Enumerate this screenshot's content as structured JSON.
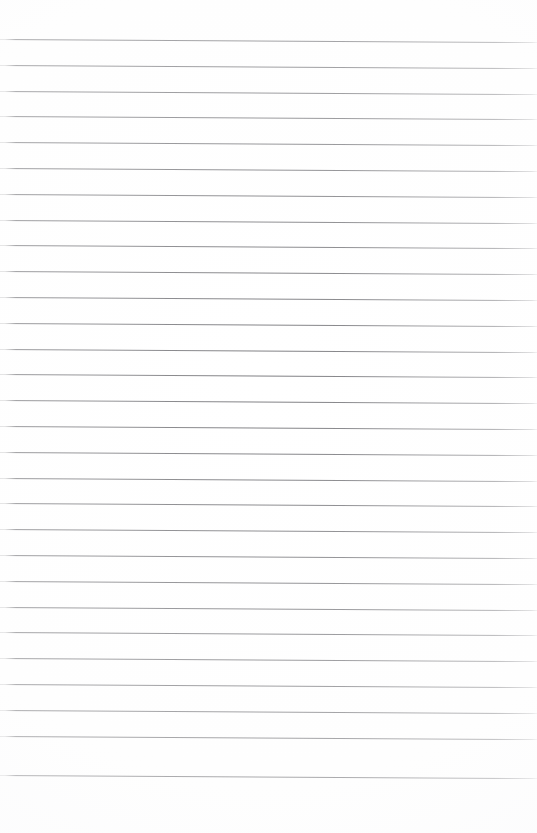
{
  "document": {
    "kind": "scanned-blank-ruled-paper",
    "page_label": "",
    "width_px": 537,
    "height_px": 833,
    "background_color": "#ffffff",
    "rule_color": "#8e8e90",
    "rule_thickness_px": 1,
    "rule_count": 29,
    "rule_pitch_px": 25.8,
    "first_rule_y_px": 39,
    "last_rule_y_px": 775,
    "rule_left_x_px": 0,
    "rule_right_x_px": 537,
    "skew_degrees": 0.33,
    "top_margin_px": 38,
    "bottom_margin_px": 55,
    "has_text": false,
    "has_handwriting": false,
    "has_margin_rule": false,
    "body_text": ""
  },
  "rules": [
    {
      "index": 1,
      "y": 39.0
    },
    {
      "index": 2,
      "y": 64.8
    },
    {
      "index": 3,
      "y": 90.6
    },
    {
      "index": 4,
      "y": 116.4
    },
    {
      "index": 5,
      "y": 142.2
    },
    {
      "index": 6,
      "y": 168.0
    },
    {
      "index": 7,
      "y": 193.8
    },
    {
      "index": 8,
      "y": 219.6
    },
    {
      "index": 9,
      "y": 245.4
    },
    {
      "index": 10,
      "y": 271.2
    },
    {
      "index": 11,
      "y": 297.0
    },
    {
      "index": 12,
      "y": 322.8
    },
    {
      "index": 13,
      "y": 348.6
    },
    {
      "index": 14,
      "y": 374.4
    },
    {
      "index": 15,
      "y": 400.2
    },
    {
      "index": 16,
      "y": 426.0
    },
    {
      "index": 17,
      "y": 451.8
    },
    {
      "index": 18,
      "y": 477.6
    },
    {
      "index": 19,
      "y": 503.4
    },
    {
      "index": 20,
      "y": 529.2
    },
    {
      "index": 21,
      "y": 555.0
    },
    {
      "index": 22,
      "y": 580.8
    },
    {
      "index": 23,
      "y": 606.6
    },
    {
      "index": 24,
      "y": 632.4
    },
    {
      "index": 25,
      "y": 658.2
    },
    {
      "index": 26,
      "y": 684.0
    },
    {
      "index": 27,
      "y": 709.8
    },
    {
      "index": 28,
      "y": 735.6
    },
    {
      "index": 29,
      "y": 775.0
    }
  ]
}
